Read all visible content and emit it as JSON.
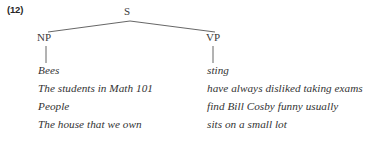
{
  "figure": {
    "example_number": "(12)",
    "tree": {
      "root_label": "S",
      "left_child_label": "NP",
      "right_child_label": "VP",
      "line_color": "#555555"
    },
    "columns": {
      "np_header": "NP",
      "vp_header": "VP"
    },
    "rows": [
      {
        "np": "Bees",
        "vp": "sting"
      },
      {
        "np": "The students in Math 101",
        "vp": "have always disliked taking exams"
      },
      {
        "np": "People",
        "vp": "find Bill Cosby funny usually"
      },
      {
        "np": "The house that we own",
        "vp": "sits on a small lot"
      }
    ]
  }
}
